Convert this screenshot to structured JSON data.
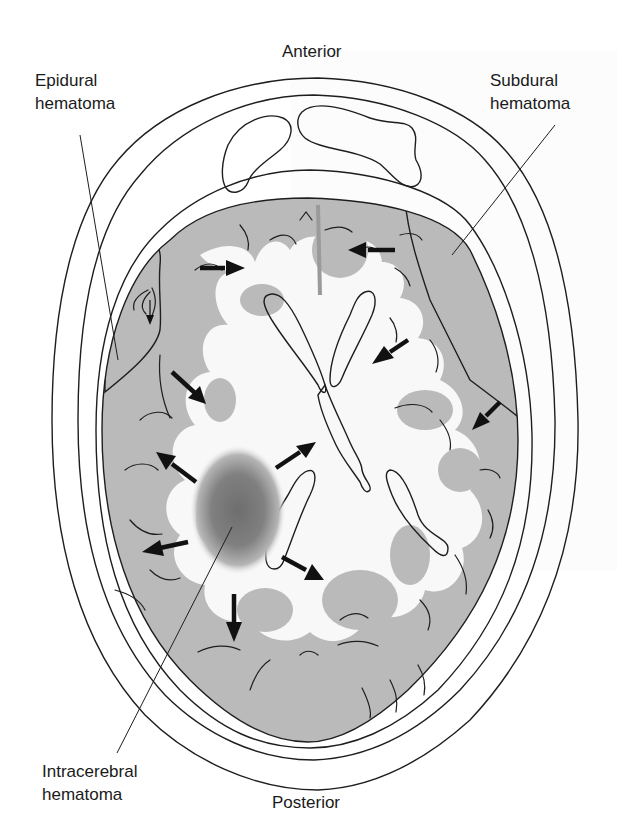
{
  "figure": {
    "type": "anatomical-diagram",
    "orientation": {
      "top": "Anterior",
      "bottom": "Posterior"
    },
    "labels": {
      "anterior": "Anterior",
      "posterior": "Posterior",
      "epidural_line1": "Epidural",
      "epidural_line2": "hematoma",
      "subdural_line1": "Subdural",
      "subdural_line2": "hematoma",
      "intracerebral_line1": "Intracerebral",
      "intracerebral_line2": "hematoma"
    },
    "arrows": {
      "description": "Black arrows indicate displacement / mass effect of brain tissue away from hematomas",
      "count": 11
    },
    "colors": {
      "background": "#ffffff",
      "scalp": "#eeeeee",
      "skull": "#e2e2e2",
      "skull_stipple": "#bdbdbd",
      "cortex_gray_matter": "#b9b9b9",
      "white_matter": "#f7f7f7",
      "ventricles": "#a9a9a9",
      "sinuses": "#9a9a9a",
      "subdural_hematoma": "#8f8f8f",
      "epidural_hematoma": "#8a8a8a",
      "intracerebral_hematoma": "#777777",
      "line": "#1e1e1e"
    }
  }
}
